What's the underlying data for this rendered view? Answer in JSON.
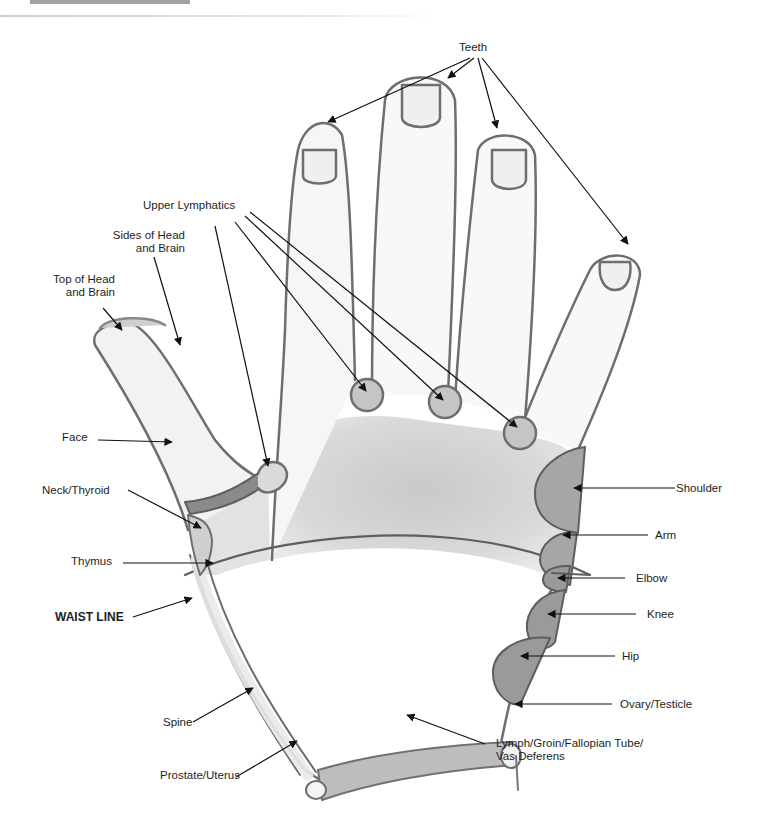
{
  "title": {
    "text": ""
  },
  "diagram": {
    "colors": {
      "outline": "#6e6e6e",
      "skin_light": "#eeeeee",
      "skin_shade": "#d2d2d2",
      "region_dark": "#9a9a9a",
      "region_mid": "#b4b4b4",
      "arrow": "#111111"
    }
  },
  "labels": {
    "teeth": "Teeth",
    "upper_lymphatics": "Upper Lymphatics",
    "sides_of_head_1": "Sides of Head",
    "sides_of_head_2": "and Brain",
    "top_of_head_1": "Top of Head",
    "top_of_head_2": "and Brain",
    "face": "Face",
    "neck_thyroid": "Neck/Thyroid",
    "thymus": "Thymus",
    "waist_line": "WAIST LINE",
    "spine": "Spine",
    "prostate_uterus": "Prostate/Uterus",
    "shoulder": "Shoulder",
    "arm": "Arm",
    "elbow": "Elbow",
    "knee": "Knee",
    "hip": "Hip",
    "ovary_testicle": "Ovary/Testicle",
    "lymph_groin_1": "Lymph/Groin/Fallopian Tube/",
    "lymph_groin_2": "Vas Deferens"
  }
}
